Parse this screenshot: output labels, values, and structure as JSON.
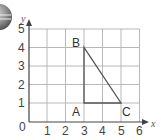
{
  "diagram": {
    "type": "coordinate-grid",
    "x_axis": {
      "label": "x",
      "ticks": [
        "0",
        "1",
        "2",
        "3",
        "4",
        "5",
        "6"
      ]
    },
    "y_axis": {
      "label": "y",
      "ticks": [
        "1",
        "2",
        "3",
        "4",
        "5"
      ]
    },
    "points": [
      {
        "label": "A",
        "x": 3,
        "y": 1
      },
      {
        "label": "B",
        "x": 3,
        "y": 4
      },
      {
        "label": "C",
        "x": 5,
        "y": 1
      }
    ],
    "shape": "triangle ABC",
    "icon": "globe-sphere-icon"
  },
  "colors": {
    "grid": "#b8b8b8",
    "axis": "#444444",
    "triangle": "#555555"
  }
}
